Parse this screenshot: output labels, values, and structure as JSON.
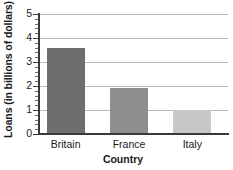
{
  "chart_data": {
    "type": "bar",
    "title": "",
    "categories": [
      "Britain",
      "France",
      "Italy"
    ],
    "values": [
      3.6,
      1.9,
      1.0
    ],
    "series": [
      {
        "name": "Loans",
        "values": [
          3.6,
          1.9,
          1.0
        ]
      }
    ],
    "xlabel": "Country",
    "ylabel": "Loans (in billions of dollars)",
    "ylim": [
      0,
      5
    ],
    "ytick_labels": [
      "0",
      "1",
      "2",
      "3",
      "4",
      "5"
    ],
    "ytick_values": [
      0,
      1,
      2,
      3,
      4,
      5
    ],
    "minor_ticks_per_interval": 4,
    "grid": true,
    "grid_axis": "y",
    "legend": false,
    "bar_colors": [
      "#6e6e6e",
      "#8e8e8e",
      "#c8c8c8"
    ],
    "grid_color": "#b9b9b9",
    "axis_color": "#3a3a3a",
    "text_color": "#1a1a1a",
    "background": "#ffffff"
  }
}
